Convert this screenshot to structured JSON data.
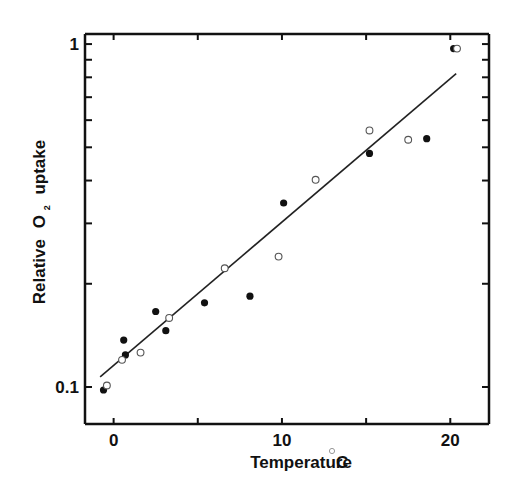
{
  "chart_data": {
    "type": "scatter",
    "title": "",
    "xlabel": "Temperature",
    "xlabel_unit": "°C",
    "ylabel_parts": [
      "Relative",
      "O",
      "2",
      "uptake"
    ],
    "ylabel": "Relative O2 uptake",
    "xlim": [
      -1.7,
      22.3
    ],
    "ylim": [
      0.078,
      1.07
    ],
    "yscale": "log",
    "grid": false,
    "legend": null,
    "x_ticks": [
      0,
      5,
      10,
      15,
      20
    ],
    "x_tick_labels": [
      {
        "value": 0,
        "label": "0"
      },
      {
        "value": 10,
        "label": "10"
      },
      {
        "value": 20,
        "label": "20"
      }
    ],
    "y_ticks": [
      0.1,
      0.2,
      0.3,
      0.4,
      0.5,
      0.6,
      0.7,
      0.8,
      0.9,
      1.0
    ],
    "y_tick_labels": [
      {
        "value": 0.1,
        "label": "0.1"
      },
      {
        "value": 1.0,
        "label": "1"
      }
    ],
    "series": [
      {
        "name": "filled",
        "marker": "filled-circle",
        "color": "#111111",
        "points": [
          {
            "x": -0.6,
            "y": 0.098
          },
          {
            "x": 0.7,
            "y": 0.124
          },
          {
            "x": 0.6,
            "y": 0.137
          },
          {
            "x": 2.5,
            "y": 0.166
          },
          {
            "x": 3.1,
            "y": 0.146
          },
          {
            "x": 5.4,
            "y": 0.176
          },
          {
            "x": 8.1,
            "y": 0.184
          },
          {
            "x": 10.1,
            "y": 0.344
          },
          {
            "x": 15.2,
            "y": 0.48
          },
          {
            "x": 18.6,
            "y": 0.53
          },
          {
            "x": 20.2,
            "y": 0.97
          }
        ]
      },
      {
        "name": "open",
        "marker": "open-circle",
        "color": "#555555",
        "points": [
          {
            "x": -0.4,
            "y": 0.101
          },
          {
            "x": 0.5,
            "y": 0.12
          },
          {
            "x": 1.6,
            "y": 0.126
          },
          {
            "x": 3.3,
            "y": 0.159
          },
          {
            "x": 6.6,
            "y": 0.222
          },
          {
            "x": 9.8,
            "y": 0.24
          },
          {
            "x": 12.0,
            "y": 0.402
          },
          {
            "x": 15.2,
            "y": 0.56
          },
          {
            "x": 17.5,
            "y": 0.526
          },
          {
            "x": 20.4,
            "y": 0.97
          }
        ]
      }
    ],
    "fit_line": {
      "name": "regression",
      "x": [
        -0.8,
        20.35
      ],
      "y": [
        0.107,
        0.82
      ]
    }
  }
}
